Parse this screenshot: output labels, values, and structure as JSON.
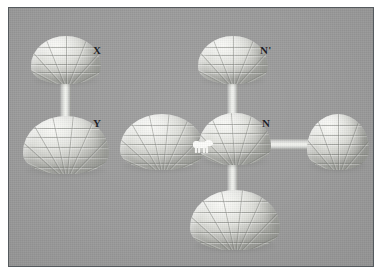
{
  "figure": {
    "kind": "3d-rendered-scene",
    "background_color": "#9b9b9b",
    "border_color": "#555a5e",
    "page_color": "#ffffff",
    "igloo_color": "#eceeea",
    "tunnel_color": "#f3f4f0",
    "bear_color": "#fdfdfb",
    "label_color": "#14161a"
  },
  "labels": {
    "x": "X",
    "y": "Y",
    "n_prime": "N'",
    "n": "N"
  },
  "igloos": [
    {
      "id": "igloo-x",
      "label": "X",
      "size": "small"
    },
    {
      "id": "igloo-y",
      "label": "Y",
      "size": "large"
    },
    {
      "id": "igloo-n-prime",
      "label": "N'",
      "size": "small"
    },
    {
      "id": "igloo-n",
      "label": "N",
      "size": "medium"
    },
    {
      "id": "igloo-left",
      "label": "",
      "size": "large"
    },
    {
      "id": "igloo-right",
      "label": "",
      "size": "large"
    },
    {
      "id": "igloo-bottom",
      "label": "",
      "size": "large"
    }
  ],
  "tunnels": [
    {
      "id": "tunnel-x-y",
      "orientation": "vertical"
    },
    {
      "id": "tunnel-nprime-n",
      "orientation": "vertical"
    },
    {
      "id": "tunnel-n-bottom",
      "orientation": "vertical"
    },
    {
      "id": "tunnel-left-n",
      "orientation": "horizontal"
    },
    {
      "id": "tunnel-n-right",
      "orientation": "horizontal"
    }
  ],
  "bear": {
    "id": "polar-bear",
    "name": "polar-bear",
    "location": "on tunnel between left igloo and igloo N"
  }
}
